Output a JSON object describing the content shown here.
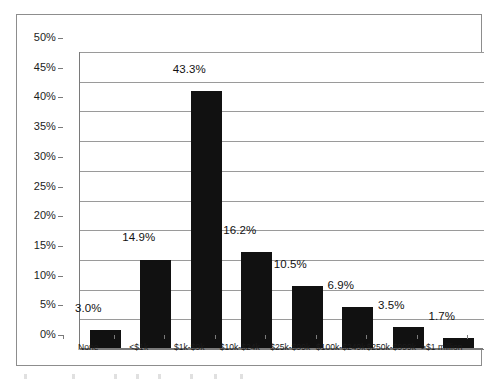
{
  "chart_data": {
    "type": "bar",
    "title": "",
    "subtitle": "",
    "xlabel": "",
    "ylabel": "",
    "ylim": [
      0,
      50
    ],
    "ytick_step": 5,
    "grid": true,
    "legend": "none",
    "orientation": "vertical",
    "bar_color": "#111111",
    "grid_color": "#9a9a9a",
    "axis_color": "#7a7a7a",
    "frame_color": "#8d8d8d",
    "background": "#ffffff",
    "categories": [
      "None",
      "<$1k",
      "$1k-$9k",
      "$10k-$24k",
      "$25k-$99k",
      "$100k-$249k",
      "$250k-$999k",
      ">$1 million"
    ],
    "values": [
      3.0,
      14.9,
      43.3,
      16.2,
      10.5,
      6.9,
      3.5,
      1.7
    ],
    "data_labels": [
      "3.0%",
      "14.9%",
      "43.3%",
      "16.2%",
      "10.5%",
      "6.9%",
      "3.5%",
      "1.7%"
    ],
    "ytick_labels": [
      "50%",
      "45%",
      "40%",
      "35%",
      "30%",
      "25%",
      "20%",
      "15%",
      "10%",
      "5%",
      "0%"
    ],
    "ytick_values": [
      50,
      45,
      40,
      35,
      30,
      25,
      20,
      15,
      10,
      5,
      0
    ]
  }
}
